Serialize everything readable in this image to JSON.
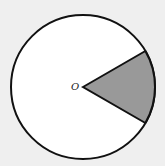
{
  "diagram": {
    "type": "circle-sector",
    "center_label": "O",
    "circle": {
      "cx": 83,
      "cy": 87,
      "r": 72
    },
    "sector": {
      "start_angle_deg": -30,
      "end_angle_deg": 30,
      "central_angle_deg": 60,
      "shaded": true
    },
    "colors": {
      "background": "#efefef",
      "circle_fill": "#ffffff",
      "stroke": "#111111",
      "sector_fill": "#999999"
    }
  }
}
